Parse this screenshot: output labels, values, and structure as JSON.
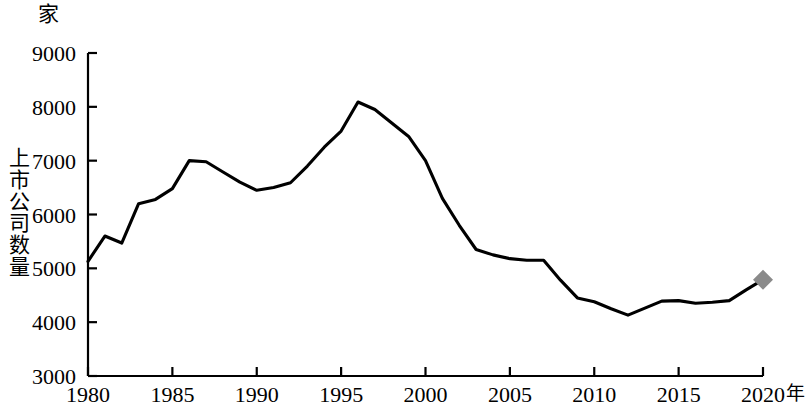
{
  "chart_data": {
    "type": "line",
    "title": "",
    "xlabel": "年",
    "ylabel": "上市公司数量",
    "yunit": "家",
    "ylim": [
      3000,
      9000
    ],
    "xlim": [
      1980,
      2020
    ],
    "ytick_labels": [
      "9000",
      "8000",
      "7000",
      "6000",
      "5000",
      "4000",
      "3000"
    ],
    "ytick_values": [
      9000,
      8000,
      7000,
      6000,
      5000,
      4000,
      3000
    ],
    "xtick_labels": [
      "1980",
      "1985",
      "1990",
      "1995",
      "2000",
      "2005",
      "2010",
      "2015",
      "2020"
    ],
    "xtick_values": [
      1980,
      1985,
      1990,
      1995,
      2000,
      2005,
      2010,
      2015,
      2020
    ],
    "grid": false,
    "legend": "none",
    "line_color": "#000000",
    "end_marker_color": "#8a8a8a",
    "end_marker_shape": "diamond",
    "x": [
      1980,
      1981,
      1982,
      1983,
      1984,
      1985,
      1986,
      1987,
      1988,
      1989,
      1990,
      1991,
      1992,
      1993,
      1994,
      1995,
      1996,
      1997,
      1998,
      1999,
      2000,
      2001,
      2002,
      2003,
      2004,
      2005,
      2006,
      2007,
      2008,
      2009,
      2010,
      2011,
      2012,
      2013,
      2014,
      2015,
      2016,
      2017,
      2018,
      2019,
      2020
    ],
    "values": [
      5130,
      5600,
      5470,
      6200,
      6280,
      6480,
      7000,
      6980,
      6790,
      6600,
      6450,
      6500,
      6590,
      6900,
      7250,
      7550,
      8090,
      7950,
      7700,
      7450,
      7000,
      6300,
      5800,
      5350,
      5250,
      5180,
      5150,
      5150,
      4780,
      4450,
      4380,
      4250,
      4130,
      4260,
      4390,
      4400,
      4350,
      4370,
      4400,
      4600,
      4790
    ]
  }
}
